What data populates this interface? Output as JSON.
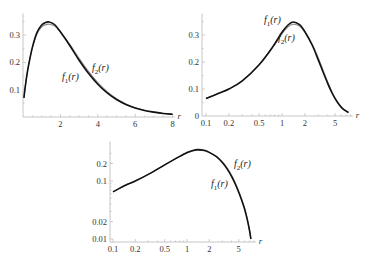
{
  "chart_data": [
    {
      "id": "top-left",
      "type": "line",
      "title": "",
      "xlabel": "r",
      "ylabel": "",
      "xscale": "linear",
      "yscale": "linear",
      "xlim": [
        0,
        8
      ],
      "ylim": [
        0,
        0.35
      ],
      "xticks": [
        2,
        4,
        6,
        8
      ],
      "xtick_labels": [
        "2",
        "4",
        "6",
        "8"
      ],
      "yticks": [
        0.1,
        0.2,
        0.3
      ],
      "ytick_labels": [
        "0.1",
        "0.2",
        "0.3"
      ],
      "grid": false,
      "frame": {
        "x0": 23,
        "y0": 117,
        "xpx_per_unit": 18.7,
        "ypx_per_unit": 273
      },
      "series": [
        {
          "name": "f1(r)",
          "color": "#111111",
          "width": 1.6,
          "x": [
            0.05,
            0.1,
            0.2,
            0.3,
            0.5,
            0.75,
            1.0,
            1.2,
            1.4,
            1.7,
            2.0,
            2.5,
            3.0,
            3.5,
            4.0,
            4.5,
            5.0,
            5.5,
            6.0,
            6.5,
            7.0,
            7.5,
            8.0
          ],
          "y": [
            0.07,
            0.1,
            0.15,
            0.19,
            0.255,
            0.31,
            0.337,
            0.346,
            0.348,
            0.338,
            0.312,
            0.262,
            0.208,
            0.16,
            0.12,
            0.088,
            0.064,
            0.046,
            0.033,
            0.024,
            0.018,
            0.013,
            0.01
          ]
        },
        {
          "name": "f2(r)",
          "color": "#888888",
          "width": 1.1,
          "x": [
            0.05,
            0.1,
            0.2,
            0.3,
            0.5,
            0.75,
            1.0,
            1.2,
            1.4,
            1.7,
            2.0,
            2.5,
            3.0,
            3.5,
            4.0,
            4.5,
            5.0,
            5.5,
            6.0,
            6.5,
            7.0,
            7.5,
            8.0
          ],
          "y": [
            0.07,
            0.1,
            0.15,
            0.19,
            0.252,
            0.305,
            0.33,
            0.338,
            0.34,
            0.333,
            0.311,
            0.266,
            0.215,
            0.167,
            0.126,
            0.093,
            0.067,
            0.048,
            0.034,
            0.025,
            0.018,
            0.013,
            0.01
          ]
        }
      ],
      "annotations": [
        {
          "text_main": "f",
          "sub": "1",
          "arg": "(r)",
          "x": 62,
          "y": 80
        },
        {
          "text_main": "f",
          "sub": "2",
          "arg": "(r)",
          "x": 92,
          "y": 71
        }
      ]
    },
    {
      "id": "top-right",
      "type": "line",
      "title": "",
      "xlabel": "r",
      "ylabel": "",
      "xscale": "log",
      "yscale": "linear",
      "xlim": [
        0.1,
        8
      ],
      "ylim": [
        0,
        0.35
      ],
      "xticks": [
        0.1,
        0.2,
        0.5,
        1,
        2,
        5
      ],
      "xtick_labels": [
        "0.1",
        "0.2",
        "0.5",
        "1",
        "2",
        "5"
      ],
      "yticks": [
        0,
        0.1,
        0.2,
        0.3
      ],
      "ytick_labels": [
        "0",
        "0.1",
        "0.2",
        "0.3"
      ],
      "grid": false,
      "frame": {
        "x0": 202,
        "xref": 206,
        "y0": 116,
        "xpx_per_decade": 76,
        "ypx_per_unit": 270
      },
      "series": [
        {
          "name": "f1(r)",
          "color": "#111111",
          "width": 1.6,
          "x": [
            0.1,
            0.15,
            0.2,
            0.3,
            0.5,
            0.75,
            1.0,
            1.2,
            1.4,
            1.7,
            2.0,
            2.5,
            3.0,
            3.5,
            4.0,
            4.5,
            5.0,
            5.5,
            6.0,
            6.5,
            7.0,
            7.5
          ],
          "y": [
            0.065,
            0.085,
            0.1,
            0.13,
            0.19,
            0.255,
            0.31,
            0.337,
            0.348,
            0.338,
            0.312,
            0.262,
            0.208,
            0.16,
            0.12,
            0.088,
            0.064,
            0.046,
            0.033,
            0.024,
            0.018,
            0.013
          ]
        },
        {
          "name": "f2(r)",
          "color": "#888888",
          "width": 1.1,
          "x": [
            0.1,
            0.15,
            0.2,
            0.3,
            0.5,
            0.75,
            1.0,
            1.2,
            1.4,
            1.7,
            2.0,
            2.5,
            3.0,
            3.5,
            4.0,
            4.5,
            5.0,
            5.5,
            6.0,
            6.5,
            7.0,
            7.5
          ],
          "y": [
            0.065,
            0.085,
            0.1,
            0.13,
            0.19,
            0.253,
            0.305,
            0.33,
            0.34,
            0.333,
            0.311,
            0.266,
            0.215,
            0.167,
            0.126,
            0.093,
            0.067,
            0.048,
            0.034,
            0.025,
            0.018,
            0.013
          ]
        }
      ],
      "annotations": [
        {
          "text_main": "f",
          "sub": "1",
          "arg": "(r)",
          "x": 264,
          "y": 23
        },
        {
          "text_main": "f",
          "sub": "2",
          "arg": "(r)",
          "x": 278,
          "y": 41
        }
      ]
    },
    {
      "id": "bottom",
      "type": "line",
      "title": "",
      "xlabel": "r",
      "ylabel": "",
      "xscale": "log",
      "yscale": "log",
      "xlim": [
        0.1,
        8
      ],
      "ylim": [
        0.01,
        0.35
      ],
      "xticks": [
        0.1,
        0.2,
        0.5,
        1,
        2,
        5
      ],
      "xtick_labels": [
        "0.1",
        "0.2",
        "0.5",
        "1",
        "2",
        "5"
      ],
      "yticks": [
        0.01,
        0.02,
        0.1,
        0.2
      ],
      "ytick_labels": [
        "0.01",
        "0.02",
        "0.1",
        "0.2"
      ],
      "grid": false,
      "frame": {
        "x0": 110,
        "xref": 113,
        "y0": 242,
        "yref": 239,
        "xpx_per_decade": 74,
        "ypx_per_decade": 58
      },
      "series": [
        {
          "name": "f1(r)",
          "color": "#111111",
          "width": 1.6,
          "x": [
            0.1,
            0.15,
            0.2,
            0.3,
            0.5,
            0.75,
            1.0,
            1.2,
            1.4,
            1.7,
            2.0,
            2.5,
            3.0,
            3.5,
            4.0,
            4.5,
            5.0,
            5.5,
            6.0,
            6.5,
            7.0,
            7.3
          ],
          "y": [
            0.065,
            0.085,
            0.1,
            0.13,
            0.19,
            0.255,
            0.31,
            0.337,
            0.348,
            0.338,
            0.312,
            0.262,
            0.208,
            0.16,
            0.12,
            0.088,
            0.064,
            0.046,
            0.033,
            0.022,
            0.014,
            0.01
          ]
        },
        {
          "name": "f2(r)",
          "color": "#888888",
          "width": 1.1,
          "x": [
            0.1,
            0.15,
            0.2,
            0.3,
            0.5,
            0.75,
            1.0,
            1.2,
            1.4,
            1.7,
            2.0,
            2.5,
            3.0,
            3.5,
            4.0,
            4.5,
            5.0,
            5.5,
            6.0,
            6.5,
            7.0,
            7.3
          ],
          "y": [
            0.065,
            0.085,
            0.1,
            0.13,
            0.19,
            0.253,
            0.305,
            0.33,
            0.34,
            0.333,
            0.311,
            0.266,
            0.215,
            0.167,
            0.126,
            0.093,
            0.067,
            0.048,
            0.034,
            0.023,
            0.014,
            0.01
          ]
        }
      ],
      "annotations": [
        {
          "text_main": "f",
          "sub": "2",
          "arg": "(r)",
          "x": 234,
          "y": 167
        },
        {
          "text_main": "f",
          "sub": "1",
          "arg": "(r)",
          "x": 211,
          "y": 187
        }
      ]
    }
  ],
  "labels": {
    "axis_variable": "r"
  }
}
